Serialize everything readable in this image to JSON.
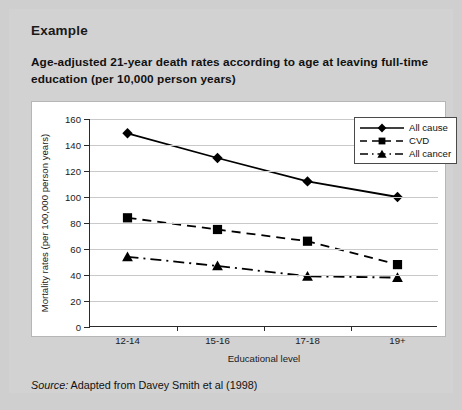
{
  "panel": {
    "example_label": "Example",
    "title": "Age-adjusted 21-year death rates according to age at leaving full-time education (per 10,000 person years)",
    "source_label": "Source:",
    "source_text": " Adapted from Davey Smith et al (1998)"
  },
  "chart_data": {
    "type": "line",
    "title": "Age-adjusted 21-year death rates according to age at leaving full-time education (per 10,000 person years)",
    "xlabel": "Educational level",
    "ylabel": "Mortality rates (per 100,000 person years)",
    "categories": [
      "12-14",
      "15-16",
      "17-18",
      "19+"
    ],
    "ylim": [
      0,
      160
    ],
    "ytick_step": 20,
    "yticks": [
      "0",
      "20",
      "40",
      "60",
      "80",
      "100",
      "120",
      "140",
      "160"
    ],
    "grid": true,
    "legend_position": "top-right",
    "series": [
      {
        "name": "All cause",
        "values": [
          149,
          130,
          112,
          100
        ],
        "marker": "diamond",
        "line_style": "solid",
        "color": "#000000"
      },
      {
        "name": "CVD",
        "values": [
          84,
          75,
          66,
          48
        ],
        "marker": "square",
        "line_style": "dashed",
        "color": "#000000"
      },
      {
        "name": "All cancer",
        "values": [
          54,
          47,
          39,
          38
        ],
        "marker": "triangle",
        "line_style": "dash-dot",
        "color": "#000000"
      }
    ]
  }
}
